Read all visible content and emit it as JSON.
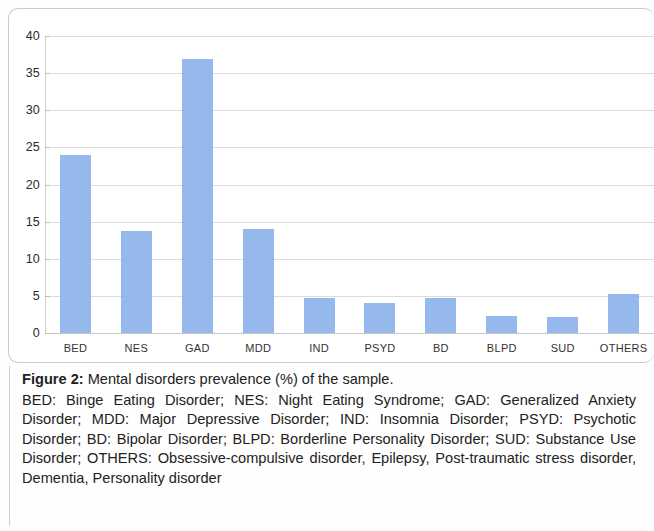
{
  "figure": {
    "label": "Figure 2:",
    "title_text": " Mental disorders prevalence (%) of the sample.",
    "abbreviations": "BED: Binge Eating Disorder; NES: Night Eating Syndrome; GAD: Generalized Anxiety Disorder; MDD: Major Depressive Disorder; IND: Insomnia Disorder; PSYD: Psychotic Disorder; BD: Bipolar Disorder; BLPD: Borderline Personality Disorder; SUD: Substance Use Disorder; OTHERS: Obsessive-compulsive disorder, Epilepsy, Post-traumatic stress disorder, Dementia, Personality disorder"
  },
  "style": {
    "bar_color": "#8cb3ea",
    "gridline_color": "#dcdcdc",
    "axis_color": "#cfcfcf",
    "text_color": "#222222",
    "panel_border_color": "#c9ccce",
    "background": "#ffffff"
  },
  "chart_data": {
    "type": "bar",
    "title": "Mental disorders prevalence (%) of the sample.",
    "xlabel": "",
    "ylabel": "",
    "ylim": [
      0,
      40
    ],
    "yticks": [
      0,
      5,
      10,
      15,
      20,
      25,
      30,
      35,
      40
    ],
    "ytick_labels": [
      "0",
      "5",
      "10",
      "15",
      "20",
      "25",
      "30",
      "35",
      "40"
    ],
    "grid": true,
    "legend": false,
    "categories": [
      "BED",
      "NES",
      "GAD",
      "MDD",
      "IND",
      "PSYD",
      "BD",
      "BLPD",
      "SUD",
      "OTHERS"
    ],
    "values": [
      24.0,
      13.7,
      36.9,
      14.0,
      4.7,
      4.1,
      4.7,
      2.3,
      2.1,
      5.3
    ],
    "series": [
      {
        "name": "Prevalence (%)",
        "values": [
          24.0,
          13.7,
          36.9,
          14.0,
          4.7,
          4.1,
          4.7,
          2.3,
          2.1,
          5.3
        ]
      }
    ],
    "points": [
      {
        "category": "BED",
        "value": 24.0,
        "full_name": "Binge Eating Disorder"
      },
      {
        "category": "NES",
        "value": 13.7,
        "full_name": "Night Eating Syndrome"
      },
      {
        "category": "GAD",
        "value": 36.9,
        "full_name": "Generalized Anxiety Disorder"
      },
      {
        "category": "MDD",
        "value": 14.0,
        "full_name": "Major Depressive Disorder"
      },
      {
        "category": "IND",
        "value": 4.7,
        "full_name": "Insomnia Disorder"
      },
      {
        "category": "PSYD",
        "value": 4.1,
        "full_name": "Psychotic Disorder"
      },
      {
        "category": "BD",
        "value": 4.7,
        "full_name": "Bipolar Disorder"
      },
      {
        "category": "BLPD",
        "value": 2.3,
        "full_name": "Borderline Personality Disorder"
      },
      {
        "category": "SUD",
        "value": 2.1,
        "full_name": "Substance Use Disorder"
      },
      {
        "category": "OTHERS",
        "value": 5.3,
        "full_name": "Obsessive-compulsive disorder, Epilepsy, Post-traumatic stress disorder, Dementia, Personality disorder"
      }
    ]
  }
}
